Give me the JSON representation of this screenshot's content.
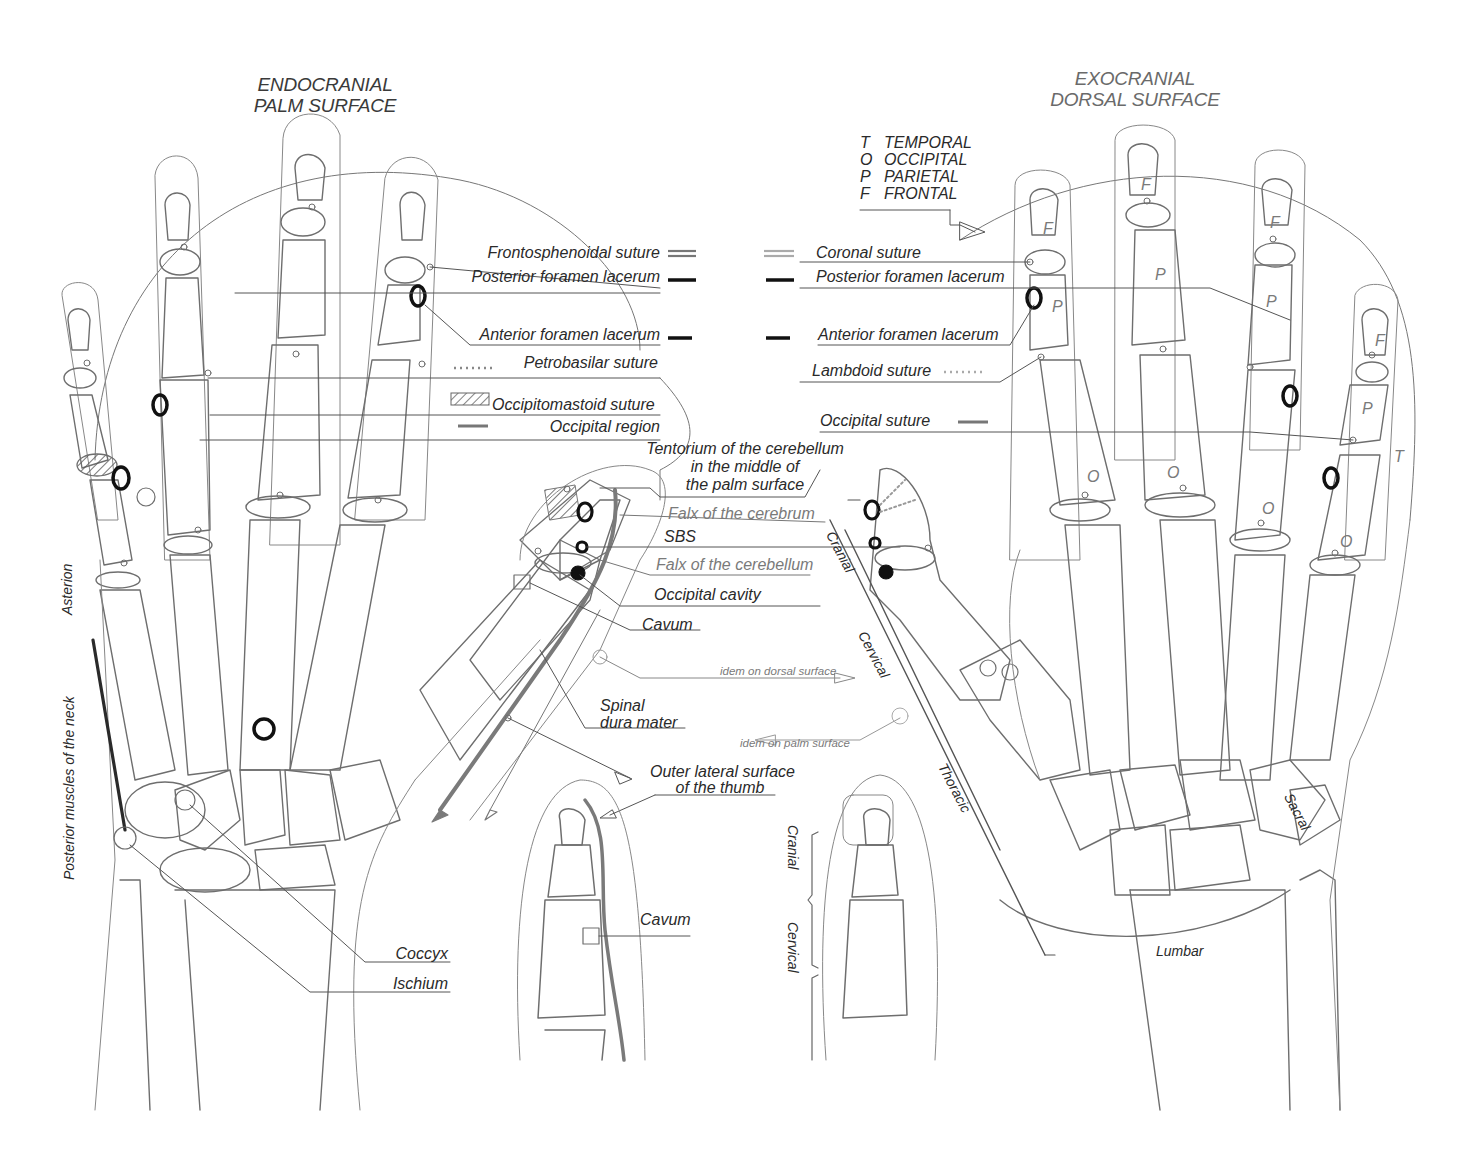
{
  "titles": {
    "left_line1": "ENDOCRANIAL",
    "left_line2": "PALM SURFACE",
    "right_line1": "EXOCRANIAL",
    "right_line2": "DORSAL SURFACE"
  },
  "bone_key": {
    "rows": [
      {
        "abbr": "T",
        "name": "TEMPORAL"
      },
      {
        "abbr": "O",
        "name": "OCCIPITAL"
      },
      {
        "abbr": "P",
        "name": "PARIETAL"
      },
      {
        "abbr": "F",
        "name": "FRONTAL"
      }
    ]
  },
  "legend_left": [
    {
      "label": "Frontosphenoidal suture",
      "symbol": "double-line",
      "color": "#777777"
    },
    {
      "label": "Posterior foramen lacerum",
      "symbol": "thick-line",
      "color": "#111111"
    },
    {
      "label": "Anterior foramen lacerum",
      "symbol": "short-thick-line",
      "color": "#111111"
    },
    {
      "label": "Petrobasilar suture",
      "symbol": "dotted-line",
      "color": "#888888"
    },
    {
      "label": "Occipitomastoid suture",
      "symbol": "hatched-box",
      "color": "#666666"
    },
    {
      "label": "Occipital region",
      "symbol": "grey-line",
      "color": "#777777"
    }
  ],
  "legend_right": [
    {
      "label": "Coronal suture",
      "symbol": "double-line",
      "color": "#aaaaaa"
    },
    {
      "label": "Posterior foramen lacerum",
      "symbol": "thick-line",
      "color": "#111111"
    },
    {
      "label": "Anterior foramen lacerum",
      "symbol": "short-thick-line",
      "color": "#111111"
    },
    {
      "label": "Lambdoid suture",
      "symbol": "dotted-line",
      "color": "#aaaaaa"
    },
    {
      "label": "Occipital suture",
      "symbol": "grey-line",
      "color": "#777777"
    }
  ],
  "center_labels": {
    "tentorium_l1": "Tentorium of the cerebellum",
    "tentorium_l2": "in the middle of",
    "tentorium_l3": "the palm surface",
    "falx_cerebrum": "Falx of the cerebrum",
    "sbs": "SBS",
    "falx_cerebellum": "Falx of the cerebellum",
    "occipital_cavity": "Occipital cavity",
    "cavum": "Cavum",
    "idem_dorsal": "idem on dorsal surface",
    "spinal_l1": "Spinal",
    "spinal_l2": "dura mater",
    "idem_palm": "idem on palm surface",
    "outer_l1": "Outer lateral surface",
    "outer_l2": "of the thumb",
    "cavum_bottom": "Cavum"
  },
  "left_side_labels": {
    "asterion": "Asterion",
    "posterior_muscles": "Posterior muscles of the neck",
    "coccyx": "Coccyx",
    "ischium": "Ischium"
  },
  "spine_regions": {
    "cranial": "Cranial",
    "cervical": "Cervical",
    "thoracic": "Thoracic",
    "lumbar": "Lumbar",
    "sacral": "Sacral"
  },
  "thumb_brackets": {
    "cranial": "Cranial",
    "cervical": "Cervical"
  },
  "bone_letters": {
    "F": "F",
    "P": "P",
    "O": "O",
    "T": "T"
  }
}
